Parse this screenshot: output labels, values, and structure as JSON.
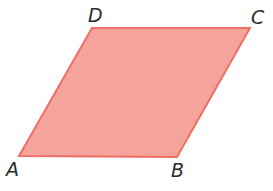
{
  "figure": {
    "shape": "parallelogram",
    "fill_color": "#f5a49c",
    "stroke_color": "#ee6e66",
    "vertices": {
      "A": {
        "label": "A",
        "x": 19,
        "y": 156
      },
      "B": {
        "label": "B",
        "x": 177,
        "y": 157
      },
      "C": {
        "label": "C",
        "x": 250,
        "y": 28
      },
      "D": {
        "label": "D",
        "x": 92,
        "y": 28
      }
    },
    "labels": {
      "A": "A",
      "B": "B",
      "C": "C",
      "D": "D"
    }
  }
}
